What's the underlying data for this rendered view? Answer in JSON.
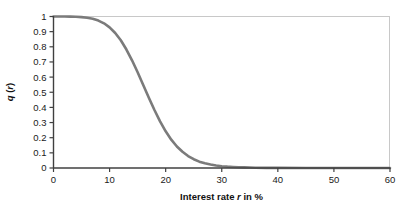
{
  "chart_data": {
    "type": "line",
    "title": "",
    "subtitle": "",
    "xlabel": "Interest rate r in %",
    "xlabel_parts": {
      "pre": "Interest rate ",
      "italic": "r",
      "post": " in %"
    },
    "ylabel": "q (r)",
    "ylabel_parts": {
      "q": "q",
      "open": " (",
      "r": "r",
      "close": ")"
    },
    "xlim": [
      0,
      60
    ],
    "ylim": [
      0,
      1
    ],
    "xticks": [
      0,
      10,
      20,
      30,
      40,
      50,
      60
    ],
    "xtick_labels": [
      "0",
      "10",
      "20",
      "30",
      "40",
      "50",
      "60"
    ],
    "yticks": [
      0,
      0.1,
      0.2,
      0.3,
      0.4,
      0.5,
      0.6,
      0.7,
      0.8,
      0.9,
      1
    ],
    "ytick_labels": [
      "0",
      "0.1",
      "0.2",
      "0.3",
      "0.4",
      "0.5",
      "0.6",
      "0.7",
      "0.8",
      "0.9",
      "1"
    ],
    "grid": false,
    "legend": null,
    "legend_position": "none",
    "annotations": [],
    "series": [
      {
        "name": "q(r)",
        "color": "#7b7b7b",
        "line_width": 2.6,
        "x": [
          0,
          1,
          2,
          3,
          4,
          5,
          6,
          7,
          8,
          9,
          10,
          11,
          12,
          13,
          14,
          15,
          16,
          17,
          18,
          19,
          20,
          21,
          22,
          23,
          24,
          25,
          26,
          27,
          28,
          29,
          30,
          31,
          32,
          33,
          34,
          35,
          36,
          38,
          40,
          45,
          50,
          55,
          60
        ],
        "values": [
          1.0,
          1.0,
          1.0,
          0.999,
          0.998,
          0.996,
          0.992,
          0.985,
          0.973,
          0.955,
          0.928,
          0.891,
          0.843,
          0.782,
          0.711,
          0.632,
          0.548,
          0.464,
          0.383,
          0.308,
          0.242,
          0.187,
          0.142,
          0.107,
          0.079,
          0.058,
          0.042,
          0.031,
          0.023,
          0.017,
          0.012,
          0.009,
          0.007,
          0.005,
          0.004,
          0.003,
          0.002,
          0.001,
          0.001,
          0.0,
          0.0,
          0.0,
          0.0
        ]
      }
    ]
  },
  "style": {
    "axis_color": "#404040",
    "frame_color": "#c8c8c8",
    "curve_color": "#7b7b7b",
    "text_color": "#1a1a1a",
    "background": "#ffffff"
  }
}
